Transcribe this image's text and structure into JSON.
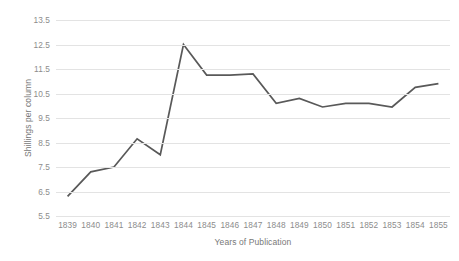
{
  "chart_data": {
    "type": "line",
    "title": "",
    "xlabel": "Years of Publication",
    "ylabel": "Shillings per column",
    "categories": [
      "1839",
      "1840",
      "1841",
      "1842",
      "1843",
      "1844",
      "1845",
      "1846",
      "1847",
      "1848",
      "1849",
      "1850",
      "1851",
      "1852",
      "1853",
      "1854",
      "1855"
    ],
    "x": [
      1839,
      1840,
      1841,
      1842,
      1843,
      1844,
      1845,
      1846,
      1847,
      1848,
      1849,
      1850,
      1851,
      1852,
      1853,
      1854,
      1855
    ],
    "values": [
      6.3,
      7.3,
      7.5,
      8.65,
      8.0,
      12.5,
      11.25,
      11.25,
      11.3,
      10.1,
      10.3,
      9.95,
      10.1,
      10.1,
      9.95,
      10.75,
      10.9
    ],
    "series": [
      {
        "name": "Shillings per column",
        "values": [
          6.3,
          7.3,
          7.5,
          8.65,
          8.0,
          12.5,
          11.25,
          11.25,
          11.3,
          10.1,
          10.3,
          9.95,
          10.1,
          10.1,
          9.95,
          10.75,
          10.9
        ]
      }
    ],
    "ylim": [
      5.5,
      13.5
    ],
    "ytick_labels": [
      "13.5",
      "12.5",
      "11.5",
      "10.5",
      "9.5",
      "8.5",
      "7.5",
      "6.5",
      "5.5"
    ],
    "ytick_values": [
      13.5,
      12.5,
      11.5,
      10.5,
      9.5,
      8.5,
      7.5,
      6.5,
      5.5
    ],
    "ytick_step": 1.0,
    "grid": true,
    "grid_axis": "y",
    "legend": false,
    "legend_position": "none",
    "line_color": "#595959",
    "grid_color": "#e3e3e3",
    "tick_label_color": "#8c8c8c",
    "axis_title_color": "#787878",
    "background_color": "#ffffff",
    "line_width": 1.7,
    "markers": false,
    "annotations": []
  }
}
